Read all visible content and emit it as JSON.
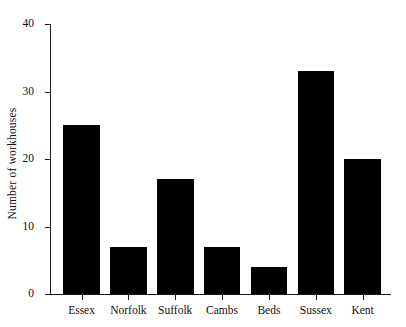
{
  "chart_data": {
    "type": "bar",
    "title": "",
    "subtitle": "",
    "xlabel": "",
    "ylabel": "Number of workhouses",
    "categories": [
      "Essex",
      "Norfolk",
      "Suffolk",
      "Cambs",
      "Beds",
      "Sussex",
      "Kent"
    ],
    "values": [
      25,
      7,
      17,
      7,
      4,
      33,
      20
    ],
    "ylim": [
      0,
      40
    ],
    "yticks": [
      0,
      10,
      20,
      30,
      40
    ],
    "ytick_labels": [
      "0",
      "10",
      "20",
      "30",
      "40"
    ],
    "grid": false,
    "legend": null,
    "bar_color": "#000000",
    "axis_color": "#1a1a1a",
    "background": "#ffffff"
  }
}
